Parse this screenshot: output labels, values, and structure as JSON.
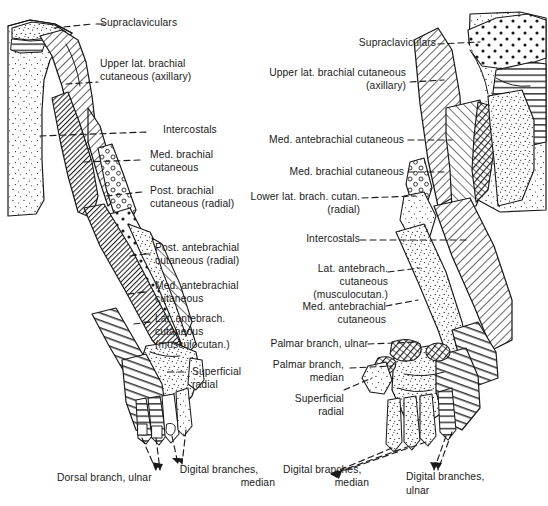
{
  "figure": {
    "background_color": "#ffffff",
    "ink_color": "#1a1a1a",
    "panels": [
      {
        "name": "posterior-view",
        "side": "left"
      },
      {
        "name": "anterior-view",
        "side": "right"
      }
    ]
  },
  "left_panel": {
    "labels": {
      "supraclaviculars": "Supraclaviculars",
      "upper_lat_brachial_1": "Upper lat. brachial",
      "upper_lat_brachial_2": "cutaneous (axillary)",
      "intercostals": "Intercostals",
      "med_brachial_1": "Med. brachial",
      "med_brachial_2": "cutaneous",
      "post_brachial_1": "Post. brachial",
      "post_brachial_2": "cutaneous (radial)",
      "post_antebrachial_1": "Post. antebrachial",
      "post_antebrachial_2": "cutaneous (radial)",
      "med_antebrachial_1": "Med. antebrachial",
      "med_antebrachial_2": "cutaneous",
      "lat_antebrach_1": "Lat. antebrach.",
      "lat_antebrach_2": "cutaneous",
      "lat_antebrach_3": "(musculocutan.)",
      "superficial_radial_1": "Superficial",
      "superficial_radial_2": "radial",
      "dorsal_branch_ulnar": "Dorsal branch, ulnar",
      "digital_branches_median_1": "Digital branches,",
      "digital_branches_median_2": "median"
    }
  },
  "right_panel": {
    "labels": {
      "supraclaviculars": "Supraclaviculars",
      "upper_lat_brachial_1": "Upper lat. brachial cutaneous",
      "upper_lat_brachial_2": "(axillary)",
      "med_antebrachial_top": "Med. antebrachial cutaneous",
      "med_brachial": "Med. brachial cutaneous",
      "lower_lat_brach_1": "Lower lat. brach. cutan.",
      "lower_lat_brach_2": "(radial)",
      "intercostals": "Intercostals",
      "lat_antebrach_1": "Lat. antebrach.",
      "lat_antebrach_2": "cutaneous",
      "lat_antebrach_3": "(musculocutan.)",
      "med_antebrachial_1": "Med. antebrachial",
      "med_antebrachial_2": "cutaneous",
      "palmar_branch_ulnar": "Palmar branch, ulnar",
      "palmar_branch_median_1": "Palmar branch,",
      "palmar_branch_median_2": "median",
      "superficial_radial_1": "Superficial",
      "superficial_radial_2": "radial",
      "digital_branches_median_1": "Digital branches,",
      "digital_branches_median_2": "median",
      "digital_branches_ulnar_1": "Digital branches,",
      "digital_branches_ulnar_2": "ulnar"
    }
  }
}
